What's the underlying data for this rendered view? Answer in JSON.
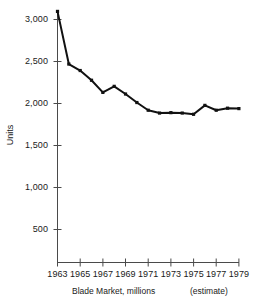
{
  "chart_data": {
    "type": "line",
    "title": "",
    "subtitle": "",
    "xlabel": "Blade Market, millions",
    "ylabel": "Units",
    "annotation": "(estimate)",
    "x": [
      1963,
      1964,
      1965,
      1966,
      1967,
      1968,
      1969,
      1970,
      1971,
      1972,
      1973,
      1974,
      1975,
      1976,
      1977,
      1978,
      1979
    ],
    "values": [
      3100,
      2450,
      2370,
      2250,
      2100,
      2175,
      2080,
      1975,
      1880,
      1845,
      1850,
      1845,
      1830,
      1940,
      1880,
      1905,
      1900
    ],
    "series": [
      {
        "name": "Units",
        "values": [
          3100,
          2450,
          2370,
          2250,
          2100,
          2175,
          2080,
          1975,
          1880,
          1845,
          1850,
          1845,
          1830,
          1940,
          1880,
          1905,
          1900
        ]
      }
    ],
    "xtick_labels": [
      "1963",
      "1965",
      "1967",
      "1969",
      "1971",
      "1973",
      "1975",
      "1977",
      "1979"
    ],
    "xtick_values": [
      1963,
      1965,
      1967,
      1969,
      1971,
      1973,
      1975,
      1977,
      1979
    ],
    "ytick_labels": [
      "500",
      "1,000",
      "1,500",
      "2,000",
      "2,500",
      "3,000"
    ],
    "ytick_values": [
      500,
      1000,
      1500,
      2000,
      2500,
      3000
    ],
    "xlim": [
      1963,
      1979
    ],
    "ylim": [
      0,
      3120
    ],
    "grid": false,
    "legend": false,
    "line_color": "#111111",
    "marker": "square",
    "background_color": "#ffffff"
  },
  "axis": {
    "y_title": "Units",
    "y_labels": {
      "t500": "500",
      "t1000": "1,000",
      "t1500": "1,500",
      "t2000": "2,000",
      "t2500": "2,500",
      "t3000": "3,000"
    },
    "x_labels": {
      "y1963": "1963",
      "y1965": "1965",
      "y1967": "1967",
      "y1969": "1969",
      "y1971": "1971",
      "y1973": "1973",
      "y1975": "1975",
      "y1977": "1977",
      "y1979": "1979"
    }
  },
  "caption": {
    "main": "Blade Market, millions",
    "estimate": "(estimate)"
  }
}
